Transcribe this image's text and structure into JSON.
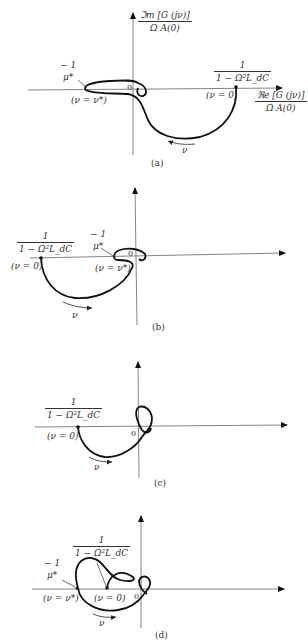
{
  "figure": {
    "axes": {
      "imag_label_num": "ℑm [G (jν)]",
      "imag_label_den": "Ω A(0)",
      "real_label_num": "ℜe [G (jν)]",
      "real_label_den": "Ω A(0)",
      "origin": "0"
    },
    "labels": {
      "mu_num": "− 1",
      "mu_den": "μ*",
      "gain_num": "1",
      "gain_den": "1 − Ω²L_dC",
      "nu_zero": "(ν = 0)",
      "nu_star": "(ν = ν*)",
      "nu": "ν"
    },
    "panels": [
      {
        "caption": "(a)"
      },
      {
        "caption": "(b)"
      },
      {
        "caption": "(c)"
      },
      {
        "caption": "(d)"
      }
    ]
  }
}
